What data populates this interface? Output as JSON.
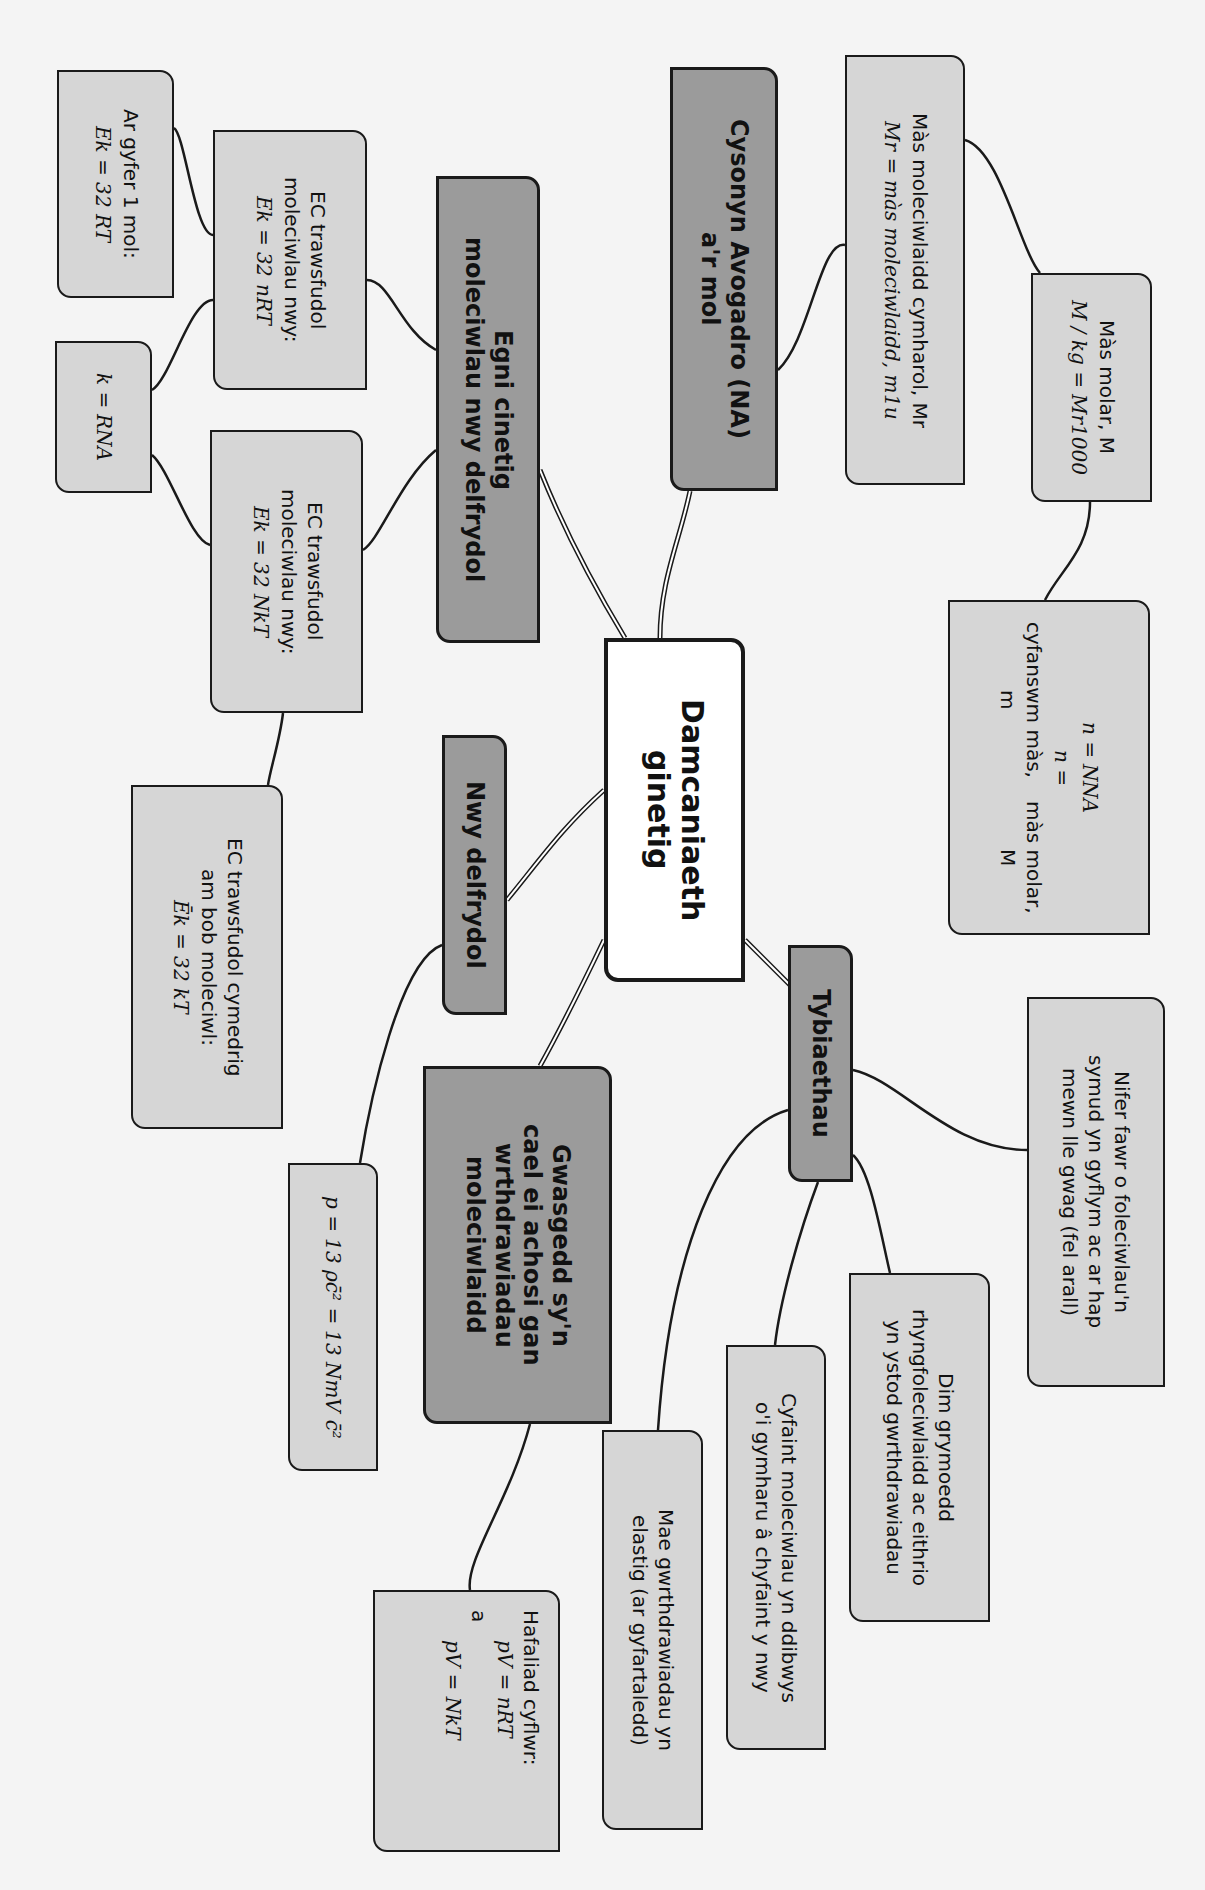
{
  "colors": {
    "background": "#f4f4f4",
    "center_fill": "#ffffff",
    "topic_fill": "#9b9b9b",
    "leaf_fill": "#d6d6d6",
    "border": "#1a1a1a"
  },
  "center": {
    "lines": [
      "Damcaniaeth",
      "ginetig"
    ]
  },
  "topics": {
    "avogadro": {
      "lines": [
        "Cysonyn Avogadro (NA)",
        "a'r mol"
      ]
    },
    "kinetic_energy": {
      "lines": [
        "Egni cinetig",
        "moleciwlau nwy delfrydol"
      ]
    },
    "ideal_gas": {
      "lines": [
        "Nwy delfrydol"
      ]
    },
    "pressure": {
      "lines": [
        "Gwasgedd sy'n",
        "cael ei achosi gan",
        "wrthdrawiadau",
        "moleciwlaidd"
      ]
    },
    "assumptions": {
      "lines": [
        "Tybiaethau"
      ]
    }
  },
  "leaves": {
    "relative_mass": {
      "title": "Màs moleciwlaidd cymharol, Mr",
      "eq_lhs": "Mr =",
      "eq_num": "màs moleciwlaidd, m",
      "eq_den": "1u"
    },
    "molar_mass": {
      "title": "Màs molar, M",
      "eq_lhs": "M / kg =",
      "eq_num": "Mr",
      "eq_den": "1000"
    },
    "moles": {
      "eq1_lhs": "n =",
      "eq1_num": "N",
      "eq1_den": "NA",
      "eq2_lhs": "n =",
      "eq2_num": "cyfanswm màs, m",
      "eq2_den": "màs molar, M"
    },
    "ec_nrt": {
      "lines": [
        "EC trawsfudol",
        "moleciwlau nwy:"
      ],
      "eq_lhs": "Ek =",
      "eq_num": "3",
      "eq_den": "2",
      "eq_rhs": "nRT"
    },
    "one_mol": {
      "lines": [
        "Ar gyfer 1 mol:"
      ],
      "eq_lhs": "Ek =",
      "eq_num": "3",
      "eq_den": "2",
      "eq_rhs": "RT"
    },
    "boltzmann": {
      "eq_lhs": "k =",
      "eq_num": "R",
      "eq_den": "NA"
    },
    "ec_nkt": {
      "lines": [
        "EC trawsfudol",
        "moleciwlau nwy:"
      ],
      "eq_lhs": "Ek =",
      "eq_num": "3",
      "eq_den": "2",
      "eq_rhs": "NkT"
    },
    "ec_mean": {
      "lines": [
        "EC trawsfudol cymedrig",
        "am bob moleciwl:"
      ],
      "eq_lhs": "Ēk =",
      "eq_num": "3",
      "eq_den": "2",
      "eq_rhs": "kT"
    },
    "pressure_eq": {
      "eq_lhs": "p =",
      "eq_num1": "1",
      "eq_den1": "3",
      "eq_mid": "ρc̄² =",
      "eq_num2": "1",
      "eq_den2": "3",
      "eq_num3": "Nm",
      "eq_den3": "V",
      "eq_rhs": "c̄²"
    },
    "gas_equation": {
      "title": "Hafaliad cyflwr:",
      "eq1": "pV = nRT",
      "conj": "a",
      "eq2": "pV = NkT"
    },
    "many_molecules": {
      "lines": [
        "Nifer fawr o foleciwlau'n",
        "symud yn gyflym ac ar hap",
        "mewn lle gwag (fel arall)"
      ]
    },
    "no_forces": {
      "lines": [
        "Dim grymoedd",
        "rhyngfoleciwlaidd ac eithrio",
        "yn ystod gwrthdrawiadau"
      ]
    },
    "volume": {
      "lines": [
        "Cyfaint moleciwlau yn ddibwys",
        "o'i gymharu â chyfaint y nwy"
      ]
    },
    "elastic": {
      "lines": [
        "Mae gwrthdrawiadau yn",
        "elastig (ar gyfartaledd)"
      ]
    }
  }
}
